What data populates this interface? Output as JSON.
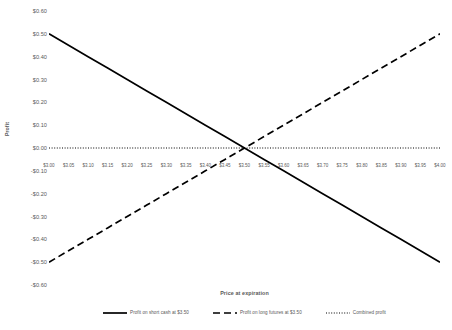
{
  "chart_data": {
    "type": "line",
    "title": "",
    "xlabel": "Price at expiration",
    "ylabel": "Profit",
    "xlim": [
      3.0,
      4.0
    ],
    "ylim": [
      -0.6,
      0.6
    ],
    "grid": false,
    "legend_position": "bottom",
    "x": [
      3.0,
      3.05,
      3.1,
      3.15,
      3.2,
      3.25,
      3.3,
      3.35,
      3.4,
      3.45,
      3.5,
      3.55,
      3.6,
      3.65,
      3.7,
      3.75,
      3.8,
      3.85,
      3.9,
      3.95,
      4.0
    ],
    "x_tick_labels": [
      "$3.00",
      "$3.05",
      "$3.10",
      "$3.15",
      "$3.20",
      "$3.25",
      "$3.30",
      "$3.35",
      "$3.40",
      "$3.45",
      "$3.50",
      "$3.55",
      "$3.60",
      "$3.65",
      "$3.70",
      "$3.75",
      "$3.80",
      "$3.85",
      "$3.90",
      "$3.95",
      "$4.00"
    ],
    "y_ticks": [
      0.6,
      0.5,
      0.4,
      0.3,
      0.2,
      0.1,
      0.0,
      -0.1,
      -0.2,
      -0.3,
      -0.4,
      -0.5,
      -0.6
    ],
    "y_tick_labels": [
      "$0.60",
      "$0.50",
      "$0.40",
      "$0.30",
      "$0.20",
      "$0.10",
      "$0.00",
      "-$0.10",
      "-$0.20",
      "-$0.30",
      "-$0.40",
      "-$0.50",
      "-$0.60"
    ],
    "series": [
      {
        "name": "Profit on short cash at $3.50",
        "style": "solid",
        "color": "#000000",
        "values": [
          0.5,
          0.45,
          0.4,
          0.35,
          0.3,
          0.25,
          0.2,
          0.15,
          0.1,
          0.05,
          0.0,
          -0.05,
          -0.1,
          -0.15,
          -0.2,
          -0.25,
          -0.3,
          -0.35,
          -0.4,
          -0.45,
          -0.5
        ]
      },
      {
        "name": "Profit on long futures at $3.50",
        "style": "dashed",
        "color": "#000000",
        "values": [
          -0.5,
          -0.45,
          -0.4,
          -0.35,
          -0.3,
          -0.25,
          -0.2,
          -0.15,
          -0.1,
          -0.05,
          0.0,
          0.05,
          0.1,
          0.15,
          0.2,
          0.25,
          0.3,
          0.35,
          0.4,
          0.45,
          0.5
        ]
      },
      {
        "name": "Combined profit",
        "style": "dotted",
        "color": "#000000",
        "values": [
          0.0,
          0.0,
          0.0,
          0.0,
          0.0,
          0.0,
          0.0,
          0.0,
          0.0,
          0.0,
          0.0,
          0.0,
          0.0,
          0.0,
          0.0,
          0.0,
          0.0,
          0.0,
          0.0,
          0.0,
          0.0
        ]
      }
    ]
  },
  "legend": {
    "entries": [
      {
        "label": "Profit on short cash at $3.50",
        "style": "solid"
      },
      {
        "label": "Profit on long futures at $3.50",
        "style": "dashed"
      },
      {
        "label": "Combined profit",
        "style": "dotted"
      }
    ]
  },
  "colors": {
    "text": "#595959",
    "line": "#000000",
    "background": "#ffffff"
  }
}
